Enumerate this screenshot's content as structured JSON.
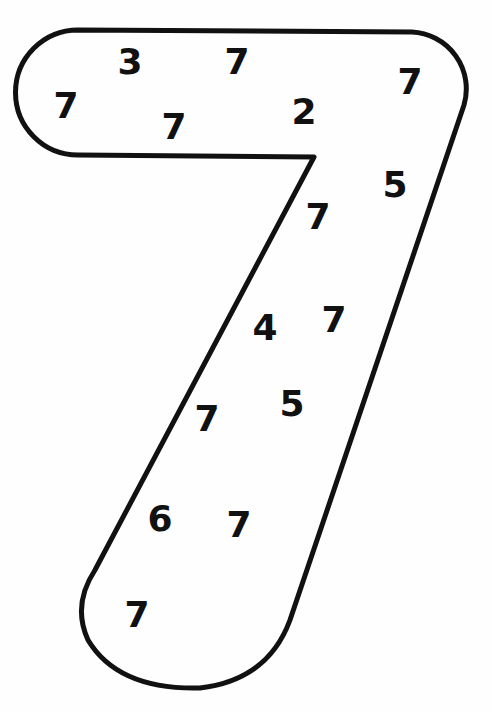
{
  "worksheet": {
    "shape": "seven",
    "outline_color": "#111111",
    "digit_color": "#111111",
    "digits": [
      {
        "value": "3",
        "x": 130,
        "y": 62
      },
      {
        "value": "7",
        "x": 237,
        "y": 62
      },
      {
        "value": "7",
        "x": 410,
        "y": 82
      },
      {
        "value": "7",
        "x": 66,
        "y": 106
      },
      {
        "value": "7",
        "x": 174,
        "y": 127
      },
      {
        "value": "2",
        "x": 304,
        "y": 112
      },
      {
        "value": "5",
        "x": 395,
        "y": 185
      },
      {
        "value": "7",
        "x": 318,
        "y": 217
      },
      {
        "value": "4",
        "x": 265,
        "y": 328
      },
      {
        "value": "7",
        "x": 334,
        "y": 320
      },
      {
        "value": "5",
        "x": 292,
        "y": 404
      },
      {
        "value": "7",
        "x": 207,
        "y": 419
      },
      {
        "value": "6",
        "x": 160,
        "y": 519
      },
      {
        "value": "7",
        "x": 239,
        "y": 525
      },
      {
        "value": "7",
        "x": 137,
        "y": 615
      }
    ]
  }
}
